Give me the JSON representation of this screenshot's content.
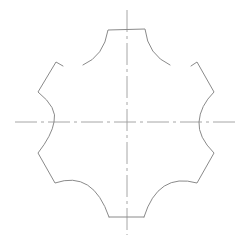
{
  "drawing": {
    "type": "cad-profile",
    "description": "Six-lobed gear/cutter profile with centerlines",
    "colors": {
      "background": "#ffffff",
      "outline": "#8a8a8a",
      "centerline": "#9c9c9c"
    },
    "center": [
      127,
      122
    ],
    "centerlines": {
      "horizontal": {
        "x1": 15,
        "x2": 238,
        "y": 122
      },
      "vertical": {
        "x": 127,
        "y1": 10,
        "y2": 235
      }
    }
  }
}
